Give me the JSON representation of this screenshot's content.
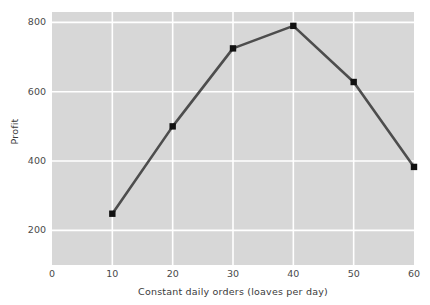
{
  "chart_data": {
    "type": "line",
    "title": "",
    "xlabel": "Constant daily orders (loaves per day)",
    "ylabel": "Profit",
    "x": [
      10,
      20,
      30,
      40,
      50,
      60
    ],
    "values": [
      248,
      500,
      725,
      790,
      628,
      383
    ],
    "series": [
      {
        "name": "Profit",
        "x": [
          10,
          20,
          30,
          40,
          50,
          60
        ],
        "values": [
          248,
          500,
          725,
          790,
          628,
          383
        ]
      }
    ],
    "xlim": [
      0,
      60
    ],
    "ylim": [
      100,
      830
    ],
    "xticks": [
      0,
      10,
      20,
      30,
      40,
      50,
      60
    ],
    "yticks": [
      200,
      400,
      600,
      800
    ],
    "xtick_labels": [
      "0",
      "10",
      "20",
      "30",
      "40",
      "50",
      "60"
    ],
    "ytick_labels": [
      "200",
      "400",
      "600",
      "800"
    ],
    "grid": true,
    "grid_color": "#ffffff",
    "panel_color": "#d7d7d7",
    "line_color": "#4d4d4d",
    "marker_color": "#111111",
    "marker_shape": "square",
    "legend": false,
    "legend_position": "none"
  },
  "colors": {
    "panel": "#d7d7d7",
    "grid": "#ffffff",
    "line": "#4d4d4d",
    "marker": "#111111",
    "text": "#3a3a3a",
    "background": "#ffffff"
  }
}
